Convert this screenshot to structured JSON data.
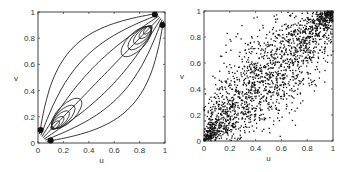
{
  "chart_data": [
    {
      "type": "contour",
      "title": "",
      "xlabel": "u",
      "ylabel": "v",
      "xlim": [
        0,
        1
      ],
      "ylim": [
        0,
        1
      ],
      "xticks": [
        "0",
        "0.2",
        "0.4",
        "0.6",
        "0.8",
        "1"
      ],
      "yticks": [
        "0",
        "0.2",
        "0.4",
        "0.6",
        "0.8",
        "1"
      ],
      "grid": false,
      "description": "Copula density contour lines concentrated at (0,0) and (1,1) corners, lens-shaped along the diagonal"
    },
    {
      "type": "scatter",
      "title": "",
      "xlabel": "u",
      "ylabel": "v",
      "xlim": [
        0,
        1
      ],
      "ylim": [
        0,
        1
      ],
      "xticks": [
        "0",
        "0.2",
        "0.4",
        "0.6",
        "0.8",
        "1"
      ],
      "yticks": [
        "0",
        "0.2",
        "0.4",
        "0.6",
        "0.8",
        "1"
      ],
      "grid": false,
      "n_points_approx": 2000,
      "description": "Scatter of samples with strong positive dependence, dense near (0,0) and (1,1)"
    }
  ]
}
